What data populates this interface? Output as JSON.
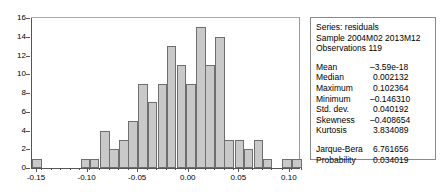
{
  "chart_data": {
    "type": "bar",
    "title": "",
    "xlabel": "",
    "ylabel": "",
    "ylim": [
      0,
      16
    ],
    "xlim": [
      -0.155,
      0.11
    ],
    "grid": false,
    "legend": "none",
    "bin_width": 0.0095,
    "ytick_labels": [
      "16",
      "14",
      "12",
      "10",
      "8",
      "6",
      "4",
      "2",
      "0"
    ],
    "ytick_values": [
      16,
      14,
      12,
      10,
      8,
      6,
      4,
      2,
      0
    ],
    "xtick_labels": [
      "-0.15",
      "-0.10",
      "-0.05",
      "0.00",
      "0.05",
      "0.10"
    ],
    "xtick_values": [
      -0.15,
      -0.1,
      -0.05,
      0.0,
      0.05,
      0.1
    ],
    "categories": [
      "-0.150",
      "-0.140",
      "-0.131",
      "-0.121",
      "-0.112",
      "-0.102",
      "-0.093",
      "-0.083",
      "-0.074",
      "-0.064",
      "-0.055",
      "-0.045",
      "-0.036",
      "-0.026",
      "-0.017",
      "-0.007",
      "0.002",
      "0.012",
      "0.021",
      "0.031",
      "0.040",
      "0.050",
      "0.059",
      "0.069",
      "0.078",
      "0.088",
      "0.097",
      "0.107"
    ],
    "values": [
      1,
      0,
      0,
      0,
      0,
      1,
      1,
      4,
      2,
      3,
      5,
      9,
      7,
      9,
      13,
      11,
      9,
      15,
      11,
      14,
      3,
      3,
      2,
      3,
      1,
      0,
      1,
      1
    ]
  },
  "stats": {
    "series_line": "Series: residuals",
    "sample_line": "Sample 2004M02 2013M12",
    "observations_line": "Observations 119",
    "rows": [
      {
        "key": "Mean",
        "value": "–3.59e-18"
      },
      {
        "key": "Median",
        "value": "0.002132"
      },
      {
        "key": "Maximum",
        "value": "0.102364"
      },
      {
        "key": "Minimum",
        "value": "–0.146310"
      },
      {
        "key": "Std. dev.",
        "value": "0.040192"
      },
      {
        "key": "Skewness",
        "value": "–0.408654"
      },
      {
        "key": "Kurtosis",
        "value": "3.834089"
      }
    ],
    "test_rows": [
      {
        "key": "Jarque-Bera",
        "value": "6.761656"
      },
      {
        "key": "Probability",
        "value": "0.034019"
      }
    ]
  },
  "colors": {
    "bar_fill": "#c9c9c9",
    "bar_border": "#6f6f6f",
    "axis": "#555555",
    "panel_border": "#8a8a8a",
    "text": "#000000",
    "background": "#ffffff"
  }
}
